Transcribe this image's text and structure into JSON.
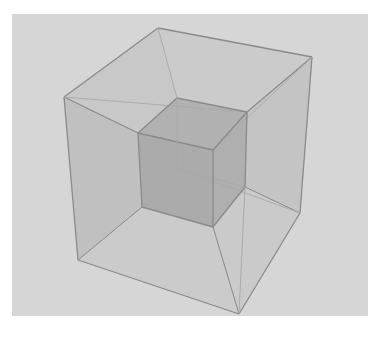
{
  "figure": {
    "type": "wireframe-cube-in-cube",
    "background_panel": {
      "x": 12,
      "y": 14,
      "width": 356,
      "height": 302,
      "color": "#d6d6d6"
    },
    "colors": {
      "edge": "#8a8a8a",
      "edge_faint": "#a8a8a8",
      "outer_face": "#c2c2c2",
      "inner_face": "#9c9c9c"
    },
    "outer_cube": {
      "vertices": {
        "top_back": [
          158,
          28
        ],
        "top_right": [
          312,
          57
        ],
        "top_left": [
          64,
          97
        ],
        "bottom_left": [
          78,
          260
        ],
        "bottom_front": [
          239,
          314
        ],
        "bottom_right": [
          300,
          213
        ]
      }
    },
    "inner_cube": {
      "vertices": {
        "top_back": [
          177,
          98
        ],
        "top_right": [
          247,
          112
        ],
        "top_left": [
          138,
          133
        ],
        "top_front": [
          213,
          150
        ],
        "bottom_back": [
          177,
          168
        ],
        "bottom_right": [
          245,
          187
        ],
        "bottom_left": [
          142,
          207
        ],
        "bottom_front": [
          213,
          227
        ]
      }
    }
  }
}
